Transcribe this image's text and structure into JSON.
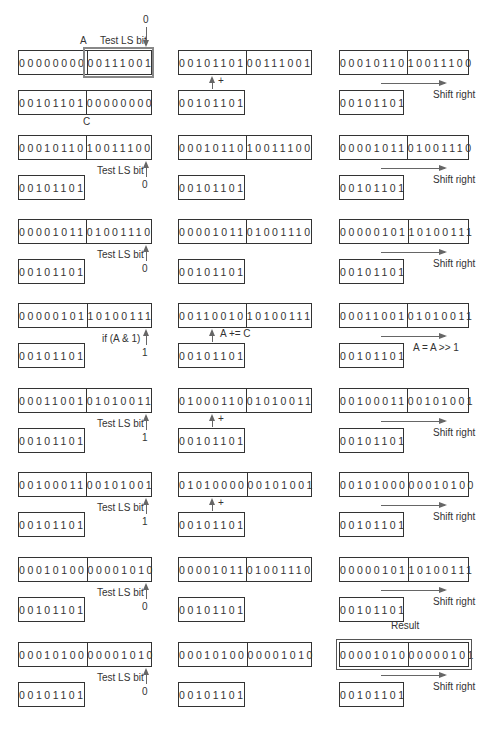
{
  "labels": {
    "A": "A",
    "C": "C",
    "test_ls_bit": "Test LS bit",
    "shift_right": "Shift right",
    "plus": "+",
    "a_plus_eq_c": "A += C",
    "if_a_and_1": "if (A & 1)",
    "a_eq_a_shr_1": "A = A >> 1",
    "result": "Result",
    "zero": "0",
    "one": "1"
  },
  "rows": [
    {
      "step1": {
        "hi": "00000000",
        "lo": "00111001",
        "c": "00101101",
        "c_lo": "00000000",
        "bit": "0"
      },
      "step2": {
        "hi": "00101101",
        "lo": "00111001",
        "c": "00101101"
      },
      "step3": {
        "hi": "00010110",
        "lo": "10011100",
        "c": "00101101"
      }
    },
    {
      "step1": {
        "hi": "00010110",
        "lo": "10011100",
        "c": "00101101",
        "bit": "0"
      },
      "step2": {
        "hi": "00010110",
        "lo": "10011100",
        "c": "00101101"
      },
      "step3": {
        "hi": "00001011",
        "lo": "01001110",
        "c": "00101101"
      }
    },
    {
      "step1": {
        "hi": "00001011",
        "lo": "01001110",
        "c": "00101101",
        "bit": "0"
      },
      "step2": {
        "hi": "00001011",
        "lo": "01001110",
        "c": "00101101"
      },
      "step3": {
        "hi": "00000101",
        "lo": "10100111",
        "c": "00101101"
      }
    },
    {
      "step1": {
        "hi": "00000101",
        "lo": "10100111",
        "c": "00101101",
        "bit": "1"
      },
      "step2": {
        "hi": "00110010",
        "lo": "10100111",
        "c": "00101101"
      },
      "step3": {
        "hi": "00011001",
        "lo": "01010011",
        "c": "00101101"
      }
    },
    {
      "step1": {
        "hi": "00011001",
        "lo": "01010011",
        "c": "00101101",
        "bit": "1"
      },
      "step2": {
        "hi": "01000110",
        "lo": "01010011",
        "c": "00101101"
      },
      "step3": {
        "hi": "00100011",
        "lo": "00101001",
        "c": "00101101"
      }
    },
    {
      "step1": {
        "hi": "00100011",
        "lo": "00101001",
        "c": "00101101",
        "bit": "1"
      },
      "step2": {
        "hi": "01010000",
        "lo": "00101001",
        "c": "00101101"
      },
      "step3": {
        "hi": "00101000",
        "lo": "00010100",
        "c": "00101101"
      }
    },
    {
      "step1": {
        "hi": "00010100",
        "lo": "00001010",
        "c": "00101101",
        "bit": "0"
      },
      "step2": {
        "hi": "00001011",
        "lo": "01001110",
        "c": "00101101"
      },
      "step3": {
        "hi": "00000101",
        "lo": "10100111",
        "c": "00101101"
      }
    },
    {
      "step1": {
        "hi": "00010100",
        "lo": "00001010",
        "c": "00101101",
        "bit": "0"
      },
      "step2": {
        "hi": "00010100",
        "lo": "00001010",
        "c": "00101101"
      },
      "step3": {
        "hi": "00001010",
        "lo": "00000101",
        "c": "00101101"
      }
    }
  ]
}
